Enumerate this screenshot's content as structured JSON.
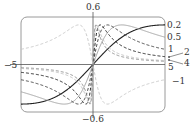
{
  "chart_data": {
    "type": "line",
    "title": "",
    "function": "y = c*x / (1 + c^2 * x^2)",
    "xlabel": "",
    "ylabel": "",
    "xlim": [
      -5,
      5
    ],
    "ylim": [
      -0.6,
      0.6
    ],
    "grid": false,
    "legend_position": "right (inline labels)",
    "tick_labels": {
      "x_left": "−5",
      "y_top": "0.6",
      "y_bottom": "−0.6"
    },
    "series": [
      {
        "name": "0.2",
        "c": 0.2,
        "style": "solid",
        "color": "#222222",
        "width": 1.1
      },
      {
        "name": "0.5",
        "c": 0.5,
        "style": "solid",
        "color": "#9a9a9a",
        "width": 0.9
      },
      {
        "name": "1",
        "c": 1,
        "style": "dashed",
        "color": "#333333",
        "width": 0.9
      },
      {
        "name": "2",
        "c": 2,
        "style": "dashed",
        "color": "#111111",
        "width": 0.9
      },
      {
        "name": "4",
        "c": 4,
        "style": "dashed",
        "color": "#bbbbbb",
        "width": 0.9
      },
      {
        "name": "5",
        "c": 5,
        "style": "dashed",
        "color": "#888888",
        "width": 0.9
      },
      {
        "name": "−1",
        "c": -1,
        "style": "dashed",
        "color": "#c4c4c4",
        "width": 0.9
      }
    ],
    "inline_labels": [
      {
        "text": "0.2",
        "x": 167,
        "y": 21
      },
      {
        "text": "0.5",
        "x": 167,
        "y": 33
      },
      {
        "text": "1",
        "x": 168,
        "y": 45
      },
      {
        "text": "2",
        "x": 184,
        "y": 48,
        "arrow_to": [
          167,
          57
        ]
      },
      {
        "text": "4",
        "x": 184,
        "y": 59,
        "arrow_to": [
          167,
          60
        ]
      },
      {
        "text": "5",
        "x": 168,
        "y": 63
      },
      {
        "text": "−1",
        "x": 172,
        "y": 77
      }
    ]
  },
  "frame": {
    "left": 21,
    "top": 17,
    "right": 165,
    "bottom": 112,
    "radius": 6
  },
  "labels": {
    "y_top": "0.6",
    "y_bottom": "−0.6",
    "x_left": "−5"
  }
}
